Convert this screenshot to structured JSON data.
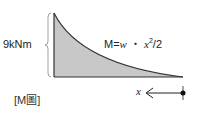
{
  "diagram": {
    "type": "bending-moment-diagram",
    "title": "[M圖]",
    "magnitude_label": "9kNm",
    "formula": {
      "prefix": "M=",
      "w": "w",
      "dot": " ・ ",
      "x": "x",
      "exp": "2",
      "suffix": "/2"
    },
    "axis_label": "x",
    "colors": {
      "fill": "#c8c8c8",
      "stroke": "#333333",
      "brace": "#888888"
    }
  }
}
